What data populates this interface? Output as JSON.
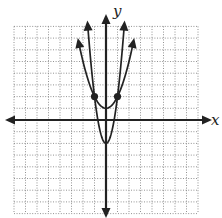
{
  "chart_data": {
    "type": "line",
    "title": "",
    "xlabel": "x",
    "ylabel": "y",
    "xlim": [
      -8,
      8
    ],
    "ylim": [
      -8,
      8
    ],
    "grid": true,
    "grid_step": 1,
    "tick_labels": false,
    "series": [
      {
        "name": "outer parabola",
        "equation": "y = x^2 + 1",
        "vertex": [
          0,
          1
        ],
        "points": [
          [
            -2.4,
            6.76
          ],
          [
            -2,
            5
          ],
          [
            -1,
            2
          ],
          [
            0,
            1
          ],
          [
            1,
            2
          ],
          [
            2,
            5
          ],
          [
            2.4,
            6.76
          ]
        ],
        "arrows_at_ends": true
      },
      {
        "name": "inner parabola",
        "equation": "y = 4x^2 - 2",
        "vertex": [
          0,
          -2
        ],
        "points": [
          [
            -1.6,
            8.24
          ],
          [
            -1,
            2
          ],
          [
            -0.5,
            -1
          ],
          [
            0,
            -2
          ],
          [
            0.5,
            -1
          ],
          [
            1,
            2
          ],
          [
            1.6,
            8.24
          ]
        ],
        "arrows_at_ends": true
      }
    ],
    "marked_points": [
      [
        -1,
        2
      ],
      [
        1,
        2
      ]
    ],
    "legend": null
  },
  "labels": {
    "x_axis": "x",
    "y_axis": "y"
  }
}
